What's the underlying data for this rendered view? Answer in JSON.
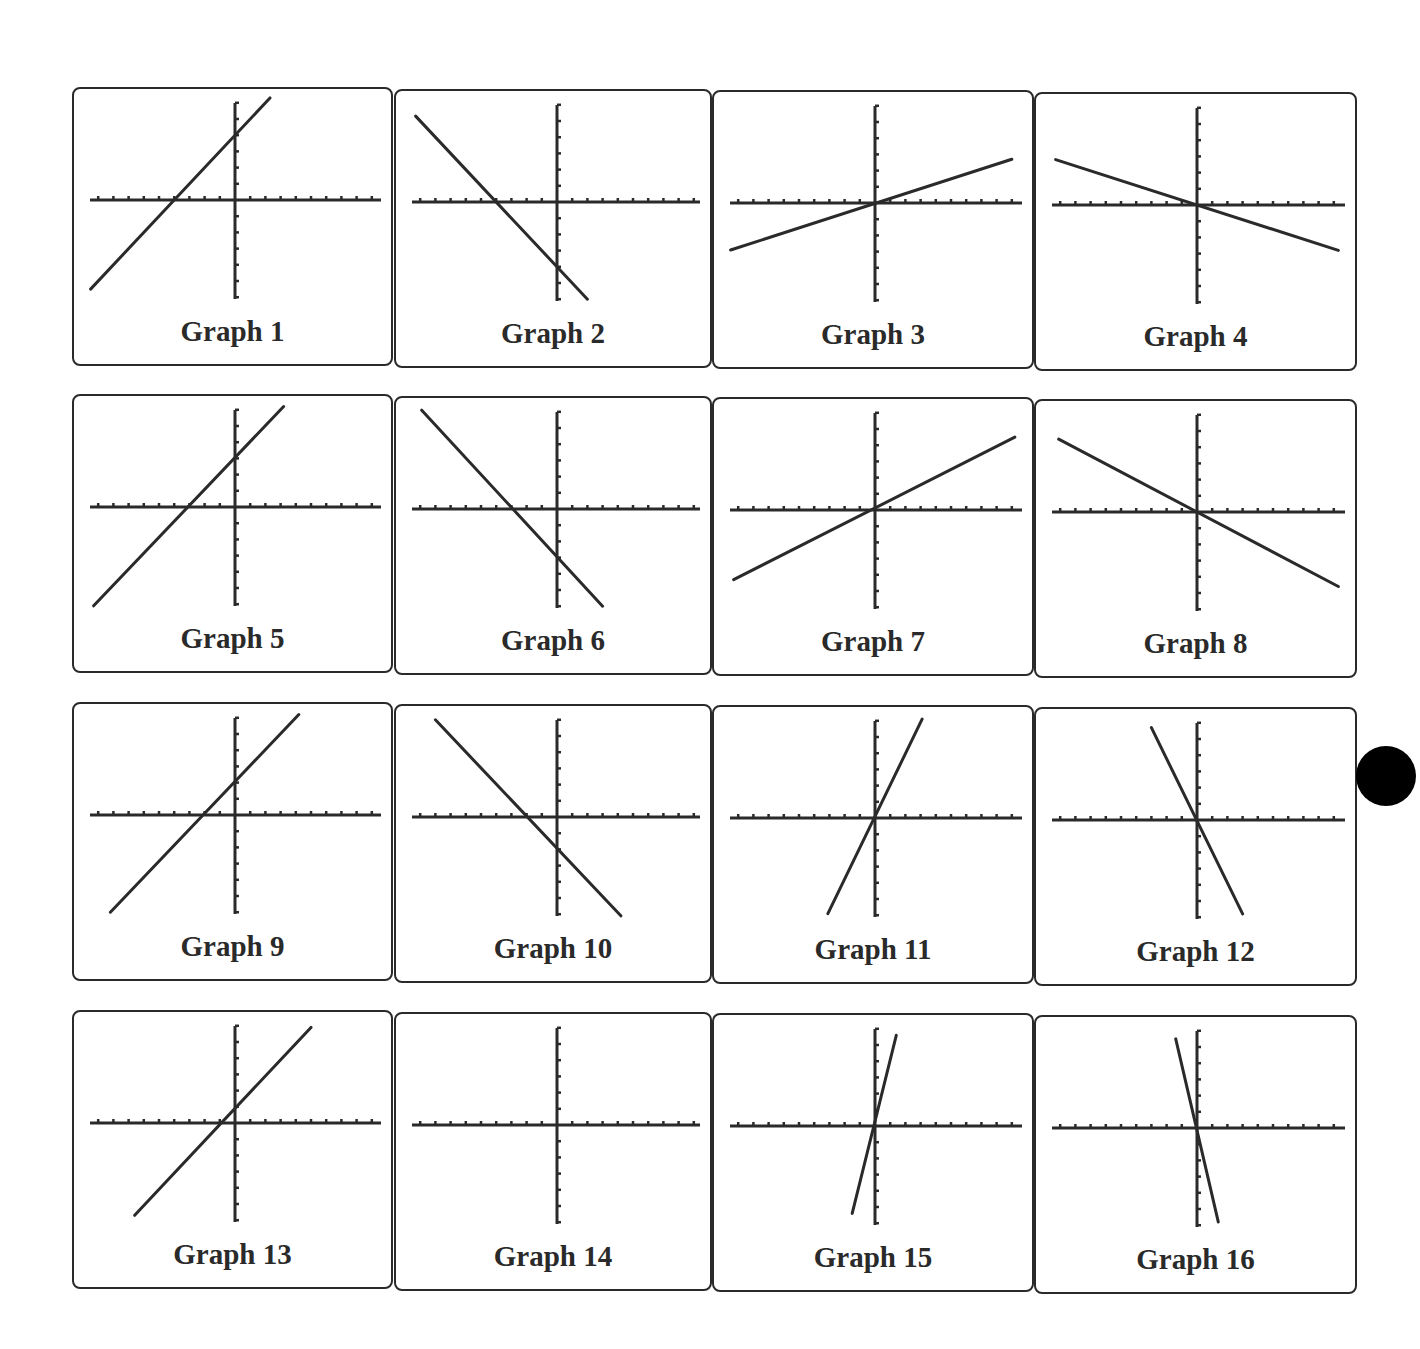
{
  "page": {
    "background": "#ffffff",
    "ink": "#2a2a2a"
  },
  "graphs": [
    {
      "label": "Graph 1",
      "equation": "y = x + 4",
      "slope": 1,
      "intercept": 4
    },
    {
      "label": "Graph 2",
      "equation": "y = -x - 4",
      "slope": -1,
      "intercept": -4
    },
    {
      "label": "Graph 3",
      "equation": "y = x/3",
      "slope": 0.333,
      "intercept": 0
    },
    {
      "label": "Graph 4",
      "equation": "y = -x/3",
      "slope": -0.333,
      "intercept": 0
    },
    {
      "label": "Graph 5",
      "equation": "y = x + 3",
      "slope": 1,
      "intercept": 3
    },
    {
      "label": "Graph 6",
      "equation": "y = -x - 3",
      "slope": -1,
      "intercept": -3
    },
    {
      "label": "Graph 7",
      "equation": "y = x/2",
      "slope": 0.5,
      "intercept": 0
    },
    {
      "label": "Graph 8",
      "equation": "y = -x/2",
      "slope": -0.5,
      "intercept": 0
    },
    {
      "label": "Graph 9",
      "equation": "y = x + 2",
      "slope": 1,
      "intercept": 2
    },
    {
      "label": "Graph 10",
      "equation": "y = -x - 2",
      "slope": -1,
      "intercept": -2
    },
    {
      "label": "Graph 11",
      "equation": "y = 2x",
      "slope": 2,
      "intercept": 0
    },
    {
      "label": "Graph 12",
      "equation": "y = -2x",
      "slope": -2,
      "intercept": 0
    },
    {
      "label": "Graph 13",
      "equation": "y = x + 1",
      "slope": 1,
      "intercept": 1
    },
    {
      "label": "Graph 14",
      "equation": "",
      "slope": null,
      "intercept": null
    },
    {
      "label": "Graph 15",
      "equation": "y = 4x",
      "slope": 4,
      "intercept": 0
    },
    {
      "label": "Graph 16",
      "equation": "y = -4x",
      "slope": -4,
      "intercept": 0
    }
  ],
  "chart_data": {
    "type": "line",
    "title": "",
    "layout": "4x4 grid of small-multiple graphing-calculator plots",
    "xlabel": "",
    "ylabel": "",
    "xlim": [
      -10,
      10
    ],
    "ylim": [
      -6,
      6
    ],
    "x_tick_step": 1,
    "y_tick_step": 1,
    "grid": false,
    "legend": null,
    "series": [
      {
        "name": "Graph 1",
        "slope": 1,
        "intercept": 4,
        "x": [
          -9.5,
          2.3
        ],
        "y": [
          -5.5,
          6.3
        ]
      },
      {
        "name": "Graph 2",
        "slope": -1,
        "intercept": -4,
        "x": [
          -9.3,
          2.0
        ],
        "y": [
          5.3,
          -6.0
        ]
      },
      {
        "name": "Graph 3",
        "slope": 0.333,
        "intercept": 0,
        "x": [
          -9.5,
          9.0
        ],
        "y": [
          -2.9,
          2.7
        ]
      },
      {
        "name": "Graph 4",
        "slope": -0.333,
        "intercept": 0,
        "x": [
          -9.3,
          9.3
        ],
        "y": [
          2.8,
          -2.8
        ]
      },
      {
        "name": "Graph 5",
        "slope": 1,
        "intercept": 3,
        "x": [
          -9.3,
          3.2
        ],
        "y": [
          -6.1,
          6.2
        ]
      },
      {
        "name": "Graph 6",
        "slope": -1,
        "intercept": -3,
        "x": [
          -8.9,
          3.0
        ],
        "y": [
          6.1,
          -6.0
        ]
      },
      {
        "name": "Graph 7",
        "slope": 0.5,
        "intercept": 0,
        "x": [
          -9.3,
          9.2
        ],
        "y": [
          -4.3,
          4.5
        ]
      },
      {
        "name": "Graph 8",
        "slope": -0.5,
        "intercept": 0,
        "x": [
          -9.1,
          9.3
        ],
        "y": [
          4.5,
          -4.6
        ]
      },
      {
        "name": "Graph 9",
        "slope": 1,
        "intercept": 2,
        "x": [
          -8.2,
          4.2
        ],
        "y": [
          -6.0,
          6.2
        ]
      },
      {
        "name": "Graph 10",
        "slope": -1,
        "intercept": -2,
        "x": [
          -8.0,
          4.2
        ],
        "y": [
          6.0,
          -6.1
        ]
      },
      {
        "name": "Graph 11",
        "slope": 2,
        "intercept": 0,
        "x": [
          -3.1,
          3.1
        ],
        "y": [
          -5.9,
          6.1
        ]
      },
      {
        "name": "Graph 12",
        "slope": -2,
        "intercept": 0,
        "x": [
          -3.0,
          3.0
        ],
        "y": [
          5.7,
          -5.8
        ]
      },
      {
        "name": "Graph 13",
        "slope": 1,
        "intercept": 1,
        "x": [
          -6.6,
          5.0
        ],
        "y": [
          -5.7,
          5.9
        ]
      },
      {
        "name": "Graph 14",
        "slope": null,
        "intercept": null,
        "x": [],
        "y": []
      },
      {
        "name": "Graph 15",
        "slope": 4,
        "intercept": 0,
        "x": [
          -1.5,
          1.4
        ],
        "y": [
          -5.4,
          5.6
        ]
      },
      {
        "name": "Graph 16",
        "slope": -4,
        "intercept": 0,
        "x": [
          -1.4,
          1.4
        ],
        "y": [
          5.5,
          -5.8
        ]
      }
    ]
  }
}
